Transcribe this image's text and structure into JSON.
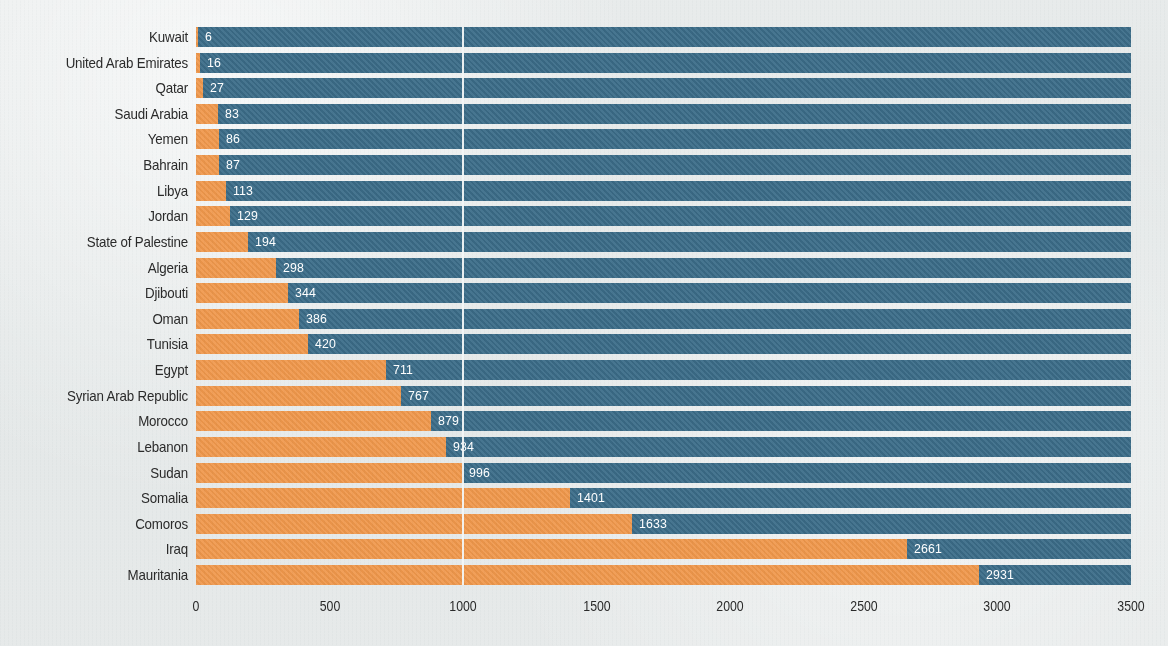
{
  "chart_data": {
    "type": "bar",
    "orientation": "horizontal",
    "stacked": true,
    "title": "",
    "subtitle": "",
    "xlabel": "",
    "ylabel": "",
    "xlim": [
      0,
      3500
    ],
    "xticks": [
      0,
      500,
      1000,
      1500,
      2000,
      2500,
      3000,
      3500
    ],
    "xtick_labels": [
      "0",
      "500",
      "1000",
      "1500",
      "2000",
      "2500",
      "3000",
      "3500"
    ],
    "grid": true,
    "gridline_values": [
      1000
    ],
    "legend": [],
    "categories": [
      "Kuwait",
      "United Arab Emirates",
      "Qatar",
      "Saudi Arabia",
      "Yemen",
      "Bahrain",
      "Libya",
      "Jordan",
      "State of Palestine",
      "Algeria",
      "Djibouti",
      "Oman",
      "Tunisia",
      "Egypt",
      "Syrian Arab Republic",
      "Morocco",
      "Lebanon",
      "Sudan",
      "Somalia",
      "Comoros",
      "Iraq",
      "Mauritania"
    ],
    "values": [
      6,
      16,
      27,
      83,
      86,
      87,
      113,
      129,
      194,
      298,
      344,
      386,
      420,
      711,
      767,
      879,
      934,
      996,
      1401,
      1633,
      2661,
      2931
    ],
    "value_labels": [
      "6",
      "16",
      "27",
      "83",
      "86",
      "87",
      "113",
      "129",
      "194",
      "298",
      "344",
      "386",
      "420",
      "711",
      "767",
      "879",
      "934",
      "996",
      "1401",
      "1633",
      "2661",
      "2931"
    ],
    "remainder_to_max": true,
    "colors": {
      "value_segment": "#f0984c",
      "remainder_segment": "#3c6d89",
      "value_label_text": "#ffffff",
      "category_label_text": "#2b2b2b",
      "axis_text": "#2b2b2b",
      "gridline": "#f2f5f5",
      "background": "#e7eaea"
    }
  }
}
